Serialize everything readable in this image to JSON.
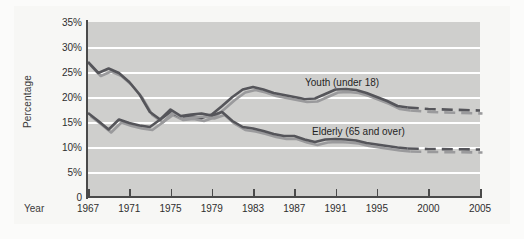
{
  "axes": {
    "y_title": "Percentage",
    "x_title": "Year",
    "y_ticks": [
      "35%",
      "30%",
      "25%",
      "20%",
      "15%",
      "10%",
      "5%",
      "0"
    ],
    "x_ticks": [
      "1967",
      "1971",
      "1975",
      "1979",
      "1983",
      "1987",
      "1991",
      "1995",
      "2000",
      "2005"
    ]
  },
  "labels": {
    "youth": "Youth (under 18)",
    "elderly": "Elderly (65 and over)"
  },
  "colors": {
    "youth_line": "#55555a",
    "youth_shadow": "#9a9a9c",
    "elderly_line": "#55555a",
    "elderly_shadow": "#9a9a9c",
    "plot_background": "#cfcfcd",
    "gridline": "#ffffff",
    "axis": "#4a4a4a"
  },
  "chart_data": {
    "type": "line",
    "title": "",
    "xlabel": "Year",
    "ylabel": "Percentage",
    "xlim": [
      1967,
      2005
    ],
    "ylim": [
      0,
      35
    ],
    "grid": true,
    "legend": "inline-annotation",
    "x": [
      1967,
      1968,
      1969,
      1970,
      1971,
      1972,
      1973,
      1974,
      1975,
      1976,
      1977,
      1978,
      1979,
      1980,
      1981,
      1982,
      1983,
      1984,
      1985,
      1986,
      1987,
      1988,
      1989,
      1990,
      1991,
      1992,
      1993,
      1994,
      1995,
      1996,
      1997,
      1998,
      2000,
      2005
    ],
    "series": [
      {
        "name": "Youth (under 18)",
        "values": [
          27.0,
          24.8,
          25.7,
          24.8,
          23.0,
          20.5,
          17.0,
          15.5,
          17.0,
          16.0,
          16.2,
          15.8,
          16.5,
          18.2,
          20.0,
          21.5,
          22.0,
          21.5,
          20.8,
          20.4,
          20.0,
          19.6,
          19.7,
          20.6,
          21.5,
          21.6,
          21.4,
          20.8,
          20.0,
          19.2,
          18.2,
          17.9,
          17.6,
          17.3
        ],
        "forecast_from": 1998,
        "style": "solid-then-dashed"
      },
      {
        "name": "Elderly (65 and over)",
        "values": [
          16.8,
          15.2,
          13.5,
          15.5,
          14.8,
          14.3,
          14.0,
          15.5,
          17.5,
          16.2,
          16.5,
          16.7,
          16.3,
          17.0,
          15.2,
          14.0,
          13.7,
          13.2,
          12.6,
          12.2,
          12.2,
          11.5,
          11.0,
          11.5,
          11.6,
          11.5,
          11.3,
          10.8,
          10.5,
          10.2,
          9.9,
          9.7,
          9.6,
          9.5
        ],
        "forecast_from": 1998,
        "style": "solid-then-dashed"
      }
    ]
  }
}
